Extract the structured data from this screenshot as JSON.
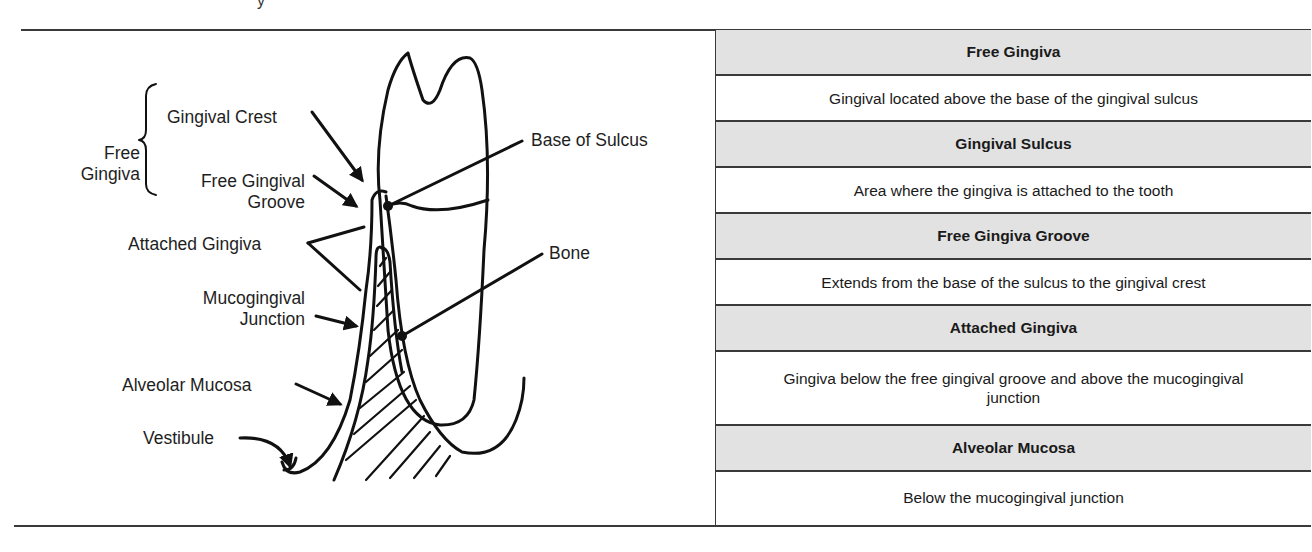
{
  "page": {
    "cut_fragment": "y"
  },
  "diagram": {
    "title_group_label": [
      "Free",
      "Gingiva"
    ],
    "labels": {
      "gingival_crest": "Gingival Crest",
      "free_gingival_groove": [
        "Free Gingival",
        "Groove"
      ],
      "base_of_sulcus": "Base of Sulcus",
      "attached_gingiva": "Attached Gingiva",
      "bone": "Bone",
      "mucogingival_junction": [
        "Mucogingival",
        "Junction"
      ],
      "alveolar_mucosa": "Alveolar Mucosa",
      "vestibule": "Vestibule"
    }
  },
  "table": {
    "header_bg": "#e2e2e2",
    "rows": [
      {
        "term": "Free Gingiva",
        "definition": "Gingival located above the base of the gingival sulcus"
      },
      {
        "term": "Gingival Sulcus",
        "definition": "Area where the gingiva is attached to the tooth"
      },
      {
        "term": "Free Gingiva Groove",
        "definition": "Extends from the base of the sulcus to the gingival crest"
      },
      {
        "term": "Attached Gingiva",
        "definition": "Gingiva below the free gingival groove and above the mucogingival junction"
      },
      {
        "term": "Alveolar Mucosa",
        "definition": "Below the mucogingival junction"
      }
    ]
  }
}
